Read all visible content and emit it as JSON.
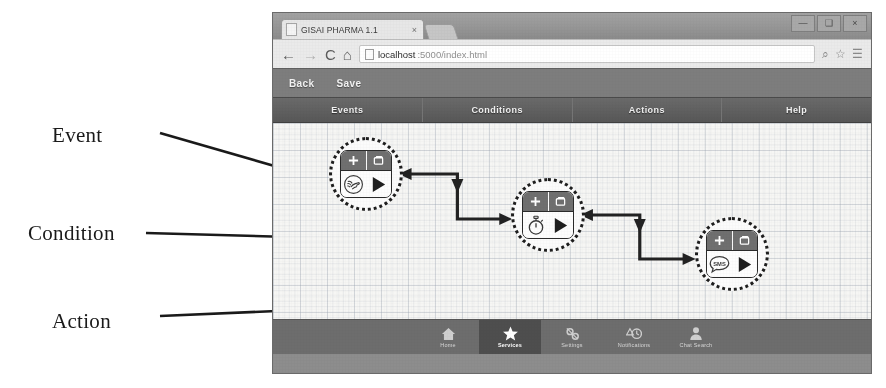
{
  "annotations": [
    {
      "label": "Event"
    },
    {
      "label": "Condition"
    },
    {
      "label": "Action"
    }
  ],
  "browser": {
    "tab": {
      "title": "GISAI PHARMA 1.1",
      "close_label": "×",
      "favicon": "page-icon"
    },
    "window_controls": [
      {
        "name": "minimize",
        "glyph": "—"
      },
      {
        "name": "maximize",
        "glyph": "❑"
      },
      {
        "name": "close",
        "glyph": "×"
      }
    ],
    "nav": {
      "back": "←",
      "forward": "→",
      "reload": "C",
      "home": "⌂"
    },
    "url": {
      "host": "localhost",
      "path": ":5000/index.html",
      "page_icon": "page-icon",
      "zoom_icon": "⌕",
      "bookmark_icon": "☆",
      "menu_icon": "☰"
    }
  },
  "app": {
    "toolbar": {
      "back_label": "Back",
      "save_label": "Save"
    },
    "tabs": [
      {
        "label": "Events"
      },
      {
        "label": "Conditions"
      },
      {
        "label": "Actions"
      },
      {
        "label": "Help"
      }
    ],
    "bottom_nav": [
      {
        "label": "Home",
        "icon": "home-icon",
        "active": false
      },
      {
        "label": "Services",
        "icon": "star-icon",
        "active": true
      },
      {
        "label": "Settings",
        "icon": "gear-icon",
        "active": false
      },
      {
        "label": "Notifications",
        "icon": "clock-icon",
        "active": false
      },
      {
        "label": "Chat Search",
        "icon": "person-icon",
        "active": false
      }
    ]
  },
  "flow": {
    "nodes": [
      {
        "id": "event",
        "kind": "Event",
        "type_icon": "nfc-tap-icon",
        "run_icon": "play-icon",
        "add_icon": "plus-icon",
        "duplicate_icon": "copy-icon"
      },
      {
        "id": "condition",
        "kind": "Condition",
        "type_icon": "stopwatch-icon",
        "run_icon": "play-icon",
        "add_icon": "plus-icon",
        "duplicate_icon": "copy-icon"
      },
      {
        "id": "action",
        "kind": "Action",
        "type_icon": "sms-bubble-icon",
        "run_icon": "play-icon",
        "add_icon": "plus-icon",
        "duplicate_icon": "copy-icon"
      }
    ],
    "connectors": [
      {
        "from": "event",
        "to": "condition"
      },
      {
        "from": "condition",
        "to": "action"
      }
    ]
  },
  "colors": {
    "window_chrome": "#8d8d8d",
    "app_toolbar": "#7d7d7d",
    "nav_bar": "#5c5c5c",
    "canvas": "#f6f6f4",
    "node_header": "#6f6f6f",
    "bottom_nav": "#6d6d6d",
    "bottom_nav_active": "#4e4e4e",
    "ink": "#1e1e1e"
  }
}
